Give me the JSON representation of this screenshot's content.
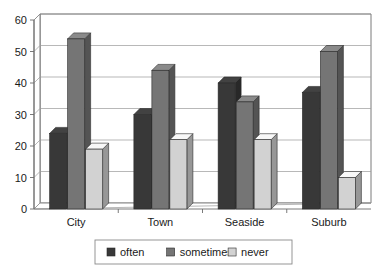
{
  "chart_data": {
    "type": "bar",
    "title": "",
    "subtitle": "",
    "xlabel": "",
    "ylabel": "",
    "ylim": [
      0,
      60
    ],
    "yticks": [
      0,
      10,
      20,
      30,
      40,
      50,
      60
    ],
    "ytick_labels": [
      "0",
      "10",
      "20",
      "30",
      "40",
      "50",
      "60"
    ],
    "grid": true,
    "style": "3d-column",
    "legend_position": "bottom",
    "categories": [
      "City",
      "Town",
      "Seaside",
      "Suburb"
    ],
    "series": [
      {
        "name": "often",
        "color": "#383838",
        "values": [
          24,
          30,
          40,
          37
        ]
      },
      {
        "name": "sometimes",
        "color": "#757575",
        "values": [
          54,
          44,
          34,
          50
        ]
      },
      {
        "name": "never",
        "color": "#d2d2d2",
        "values": [
          19,
          22,
          22,
          10
        ]
      }
    ]
  },
  "legend": {
    "items": [
      {
        "label": "often",
        "color": "#383838"
      },
      {
        "label": "sometimes",
        "color": "#757575"
      },
      {
        "label": "never",
        "color": "#d2d2d2"
      }
    ]
  },
  "axes": {
    "y_tick_labels": [
      "60",
      "50",
      "40",
      "30",
      "20",
      "10",
      "0"
    ],
    "x_tick_labels": [
      "City",
      "Town",
      "Seaside",
      "Suburb"
    ]
  },
  "colors": {
    "often": "#383838",
    "sometimes": "#757575",
    "never": "#d2d2d2",
    "grid": "#9a9a9a",
    "axis": "#6b6b6b",
    "background": "#ffffff",
    "text": "#1a1a1a"
  }
}
